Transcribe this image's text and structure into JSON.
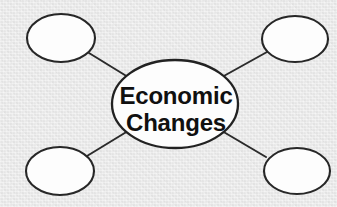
{
  "diagram": {
    "type": "concept-map",
    "title": "Economic Changes",
    "background_color": "#e9e9e9",
    "node_fill_color": "#fdfdfd",
    "node_stroke_color": "#272727",
    "text_color": "#101010",
    "center_node": {
      "label_line_1": "Economic",
      "label_line_2": "Changes",
      "cx": 175,
      "cy": 104,
      "rx": 63,
      "ry": 44
    },
    "satellite_nodes": [
      {
        "name": "top-left",
        "label": "",
        "cx": 61,
        "cy": 38,
        "rx": 34,
        "ry": 24
      },
      {
        "name": "top-right",
        "label": "",
        "cx": 295,
        "cy": 39,
        "rx": 33,
        "ry": 23
      },
      {
        "name": "bottom-left",
        "label": "",
        "cx": 60,
        "cy": 171,
        "rx": 34,
        "ry": 24
      },
      {
        "name": "bottom-right",
        "label": "",
        "cx": 297,
        "cy": 171,
        "rx": 33,
        "ry": 23
      }
    ],
    "connectors": [
      {
        "name": "center-to-top-left",
        "x1": 128,
        "y1": 77,
        "x2": 89,
        "y2": 53
      },
      {
        "name": "center-to-top-right",
        "x1": 222,
        "y1": 77,
        "x2": 267,
        "y2": 52
      },
      {
        "name": "center-to-bottom-left",
        "x1": 128,
        "y1": 131,
        "x2": 87,
        "y2": 156
      },
      {
        "name": "center-to-bottom-right",
        "x1": 222,
        "y1": 131,
        "x2": 266,
        "y2": 157
      }
    ]
  }
}
